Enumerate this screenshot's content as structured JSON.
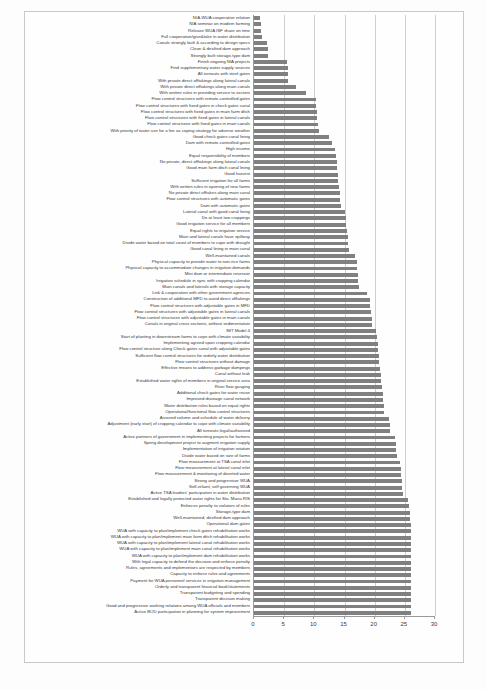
{
  "chart_data": {
    "type": "bar",
    "orientation": "horizontal",
    "title": "",
    "xlabel": "",
    "ylabel": "",
    "xlim": [
      0,
      30
    ],
    "xticks": [
      0,
      5,
      10,
      15,
      20,
      25,
      30
    ],
    "grid": true,
    "legend": "none",
    "bar_color": "#808080",
    "categories": [
      "NIA-WUA cooperative relation",
      "NIA seminar on modern farming",
      "Release WUA ISF share on time",
      "Full cooperation/give&take in water distribution",
      "Canals strongly built & according to design specs",
      "Clean & desilted dam approach",
      "Strongly built storage-type dam",
      "Finish ongoing NIA projects",
      "Find supplementary water supply sources",
      "All turnouts with steel gates",
      "With private direct offtakings along lateral canals",
      "With private direct offtakings along main canals",
      "With written rules in providing service to sectors",
      "Flow control structures with remote-controlled gates",
      "Flow control structures with fixed gates in check gates canal",
      "Flow control structures with fixed gates in main farm ditch",
      "Flow control structures with fixed gates in lateral canals",
      "Flow control structures with fixed gates in main canals",
      "With priority of water use for a fee as coping strategy for adverse weather",
      "Good check gates canal lining",
      "Dam with remote-controlled gates",
      "High income",
      "Equal responsibility of members",
      "No private, direct offtakings along lateral canals",
      "Good main farm ditch canal lining",
      "Good harvest",
      "Sufficient irrigation for all farms",
      "With written rules in opening of new farms",
      "No private direct offtakes along main canal",
      "Flow control structures with automatic gates",
      "Dam with automatic gates",
      "Lateral canal with good canal lining",
      "Do at least two croppings",
      "Good irrigation service for all members",
      "Equal rights to irrigation service",
      "Main and lateral canals have spillway",
      "Divide water based on total count of members to cope with drought",
      "Good canal lining in main canal",
      "Well-maintained canals",
      "Physical capacity to provide water to non-rice farms",
      "Physical capacity to accommodate changes in irrigation demands",
      "Mini dam or intermediate reservoir",
      "Irrigation schedule in sync with cropping calendar",
      "Main canals and laterals with storage capacity",
      "Link & cooperation with other government agencies",
      "Construction of additional MFD to avoid direct offtakings",
      "Flow control structures with adjustable gates in MFD",
      "Flow control structures with adjustable gates in lateral canals",
      "Flow control structures with adjustable gates in main canals",
      "Canals in original cross sections, without sedimentation",
      "IMT Model 4",
      "Start of planting in downstream farms to cope with climate variability",
      "Implementing agreed upon cropping calendar",
      "Flow control structure along Check gates canal with adjustable gates",
      "Sufficient flow control structures for orderly water distribution",
      "Flow control structures without damage",
      "Effective means to address garbage dumpings",
      "Canal without leak",
      "Established water rights of members in original service area",
      "River flow gauging",
      "Additional check gates for water reuse",
      "Improved drainage canal network",
      "Water distribution rules based on equal rights",
      "Operational/functional flow control structures",
      "Assured volume and schedule of water delivery",
      "Adjustment (early start) of cropping calendar to cope with climate variability",
      "All turnouts legal/authorized",
      "Active partners of government in implementing projects for farmers",
      "Spring development project to augment irrigation supply",
      "Implementation of irrigation rotation",
      "Divide water based on size of farms",
      "Flow measurement at TSA canal inlet",
      "Flow measurement at lateral canal inlet",
      "Flow measurement & monitoring of diverted water",
      "Strong and progressive WUA",
      "Self-reliant, self governing WUA",
      "Active TSA leaders' participation in water distribution",
      "Established and legally protected water rights for Sta. Maria RIS",
      "Enforces penalty to violators of rules",
      "Storage-type dam",
      "Well-maintained, desilted dam approach",
      "Operational dam gates",
      "WUA with capacity to plan/implement check gates rehabilitation works",
      "WUA with capacity to plan/implement main farm ditch rehabilitation works",
      "WUA with capacity to plan/implement lateral canal rehabilitation works",
      "WUA with capacity to plan/implement main canal rehabilitation works",
      "WUA with capacity to plan/implement dam rehabilitation works",
      "With legal capacity to defend the decision and enforce penalty",
      "Rules, agreements and implementors are respected by members",
      "Capacity to enforce rules and agreements",
      "Payment for WUA personnel services in irrigation management",
      "Orderly and transparent financial book/statements",
      "Transparent budgeting and spending",
      "Transparent decision making",
      "Good and progressive working relations among WUA officials and members",
      "Active BOD participation in planning for system improvement"
    ],
    "values": [
      1.0,
      1.1,
      1.2,
      1.4,
      2.2,
      2.3,
      2.4,
      5.5,
      5.6,
      5.6,
      5.7,
      7.0,
      8.6,
      10.2,
      10.3,
      10.4,
      10.5,
      10.6,
      10.7,
      12.5,
      13.0,
      13.5,
      13.6,
      13.7,
      13.8,
      13.9,
      14.0,
      14.1,
      14.2,
      14.3,
      14.4,
      15.1,
      15.2,
      15.3,
      15.4,
      15.5,
      15.6,
      15.7,
      16.8,
      17.0,
      17.1,
      17.2,
      17.3,
      17.4,
      18.7,
      19.2,
      19.3,
      19.4,
      19.5,
      19.6,
      20.2,
      20.4,
      20.5,
      20.6,
      20.7,
      20.8,
      20.9,
      21.0,
      21.1,
      21.2,
      21.3,
      21.4,
      21.5,
      21.6,
      22.4,
      22.5,
      22.6,
      23.4,
      23.5,
      23.6,
      23.7,
      24.2,
      24.3,
      24.4,
      24.5,
      24.6,
      24.7,
      25.6,
      25.7,
      25.8,
      25.9,
      26.0,
      26.0,
      26.0,
      26.0,
      26.0,
      26.0,
      26.0,
      26.0,
      26.0,
      26.0,
      26.0,
      26.0,
      26.0,
      26.0,
      26.0
    ]
  }
}
